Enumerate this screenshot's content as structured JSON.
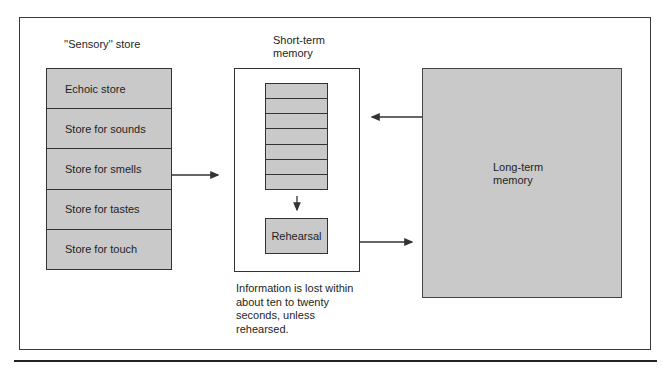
{
  "diagram": {
    "sensory": {
      "title": "''Sensory'' store",
      "rows": [
        {
          "label": "Echoic store"
        },
        {
          "label": "Store for sounds"
        },
        {
          "label": "Store for smells"
        },
        {
          "label": "Store for tastes"
        },
        {
          "label": "Store for touch"
        }
      ]
    },
    "short_term": {
      "title_line1": "Short-term",
      "title_line2": "memory",
      "slot_count": 7,
      "rehearsal_label": "Rehearsal",
      "caption_lines": [
        "Information is lost within",
        "about ten to twenty",
        "seconds, unless",
        "rehearsed."
      ]
    },
    "long_term": {
      "label_line1": "Long-term",
      "label_line2": "memory"
    },
    "arrows": [
      {
        "from": "sensory-store",
        "to": "short-term-memory"
      },
      {
        "from": "short-term-slots",
        "to": "rehearsal"
      },
      {
        "from": "short-term-memory",
        "to": "long-term-memory"
      },
      {
        "from": "long-term-memory",
        "to": "short-term-memory"
      }
    ],
    "colors": {
      "box_fill": "#c9c9c9",
      "stroke": "#333333",
      "background": "#ffffff"
    }
  }
}
